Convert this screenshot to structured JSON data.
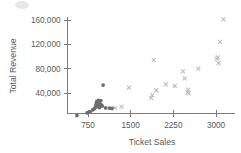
{
  "chart_data": {
    "type": "scatter",
    "title": "",
    "xlabel": "Ticket Sales",
    "ylabel": "Total Revenue",
    "xlim": [
      400,
      3200
    ],
    "ylim": [
      0,
      172000
    ],
    "xticks": [
      750,
      1500,
      2250,
      3000
    ],
    "xtick_labels": [
      "750",
      "1500",
      "2250",
      "3000"
    ],
    "yticks": [
      40000,
      80000,
      120000,
      160000
    ],
    "ytick_labels": [
      "40,000",
      "80,000",
      "120,000",
      "160,000"
    ],
    "grid": false,
    "legend": "none",
    "series": [
      {
        "name": "series-dark-circles",
        "marker": "circle",
        "color": "#6d6e71",
        "points": [
          [
            555,
            3000
          ],
          [
            735,
            7500
          ],
          [
            790,
            9500
          ],
          [
            835,
            12500
          ],
          [
            865,
            14500
          ],
          [
            880,
            16500
          ],
          [
            890,
            20000
          ],
          [
            900,
            23000
          ],
          [
            905,
            26000
          ],
          [
            910,
            19000
          ],
          [
            915,
            22500
          ],
          [
            920,
            25500
          ],
          [
            925,
            18000
          ],
          [
            930,
            21000
          ],
          [
            935,
            28000
          ],
          [
            940,
            24000
          ],
          [
            950,
            16000
          ],
          [
            960,
            22000
          ],
          [
            975,
            27500
          ],
          [
            985,
            20500
          ],
          [
            1000,
            18500
          ],
          [
            1015,
            53000
          ],
          [
            1060,
            15500
          ],
          [
            1130,
            15000
          ],
          [
            1175,
            14500
          ]
        ]
      },
      {
        "name": "series-light-crosses",
        "marker": "x",
        "color": "#bcbec0",
        "points": [
          [
            1225,
            15500
          ],
          [
            1340,
            17500
          ],
          [
            1470,
            49000
          ],
          [
            1860,
            32000
          ],
          [
            1880,
            36500
          ],
          [
            1905,
            94000
          ],
          [
            1950,
            44500
          ],
          [
            2120,
            54000
          ],
          [
            2275,
            51500
          ],
          [
            2420,
            75500
          ],
          [
            2450,
            64000
          ],
          [
            2500,
            41000
          ],
          [
            2510,
            45500
          ],
          [
            2520,
            39500
          ],
          [
            2690,
            80000
          ],
          [
            3015,
            96000
          ],
          [
            3030,
            98500
          ],
          [
            3045,
            89000
          ],
          [
            3070,
            124000
          ],
          [
            3130,
            161000
          ]
        ]
      }
    ]
  },
  "axes": {
    "y_title": "Total Revenue",
    "x_title": "Ticket Sales"
  }
}
